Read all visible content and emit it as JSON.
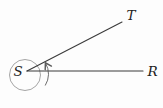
{
  "figure": {
    "labels": {
      "vertex": "S",
      "upper_ray_endpoint": "T",
      "right_ray_endpoint": "R"
    },
    "colors": {
      "background": "#fdfdfd",
      "ray_stroke": "#3b3b3b",
      "circle_stroke": "#9b9b9b",
      "arc_stroke": "#5c5c5c",
      "label_text": "#222222"
    }
  }
}
